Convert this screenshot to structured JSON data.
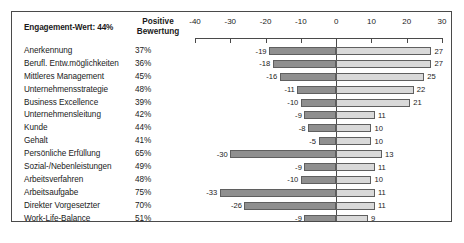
{
  "header": {
    "engagement_title": "Engagement-Wert: 44%",
    "positive_line1": "Positive",
    "positive_line2": "Bewertung"
  },
  "chart_data": {
    "type": "bar",
    "orientation": "horizontal",
    "style": "diverging-stacked",
    "title": "Engagement-Wert: 44%",
    "xlabel": "",
    "ylabel": "",
    "xlim": [
      -40,
      30
    ],
    "xticks": [
      -40,
      -30,
      -20,
      -10,
      0,
      10,
      20,
      30
    ],
    "xtick_labels": [
      "-40",
      "-30",
      "-20",
      "-10",
      "0",
      "10",
      "20",
      "30"
    ],
    "grid": false,
    "legend": null,
    "axis_position": "top",
    "columns": [
      "Kategorie",
      "Positive Bewertung",
      "Negativ",
      "Positiv"
    ],
    "categories": [
      "Anerkennung",
      "Berufl. Entw.möglichkeiten",
      "Mittleres Management",
      "Unternehmensstrategie",
      "Business Excellence",
      "Unternehmensleitung",
      "Kunde",
      "Gehalt",
      "Persönliche Erfüllung",
      "Sozial-/Nebenleistungen",
      "Arbeitsverfahren",
      "Arbeitsaufgabe",
      "Direkter Vorgesetzter",
      "Work-Life-Balance",
      "Arbeitsmittel/Ressourcen",
      "Kollegen"
    ],
    "positive_bewertung": [
      "37%",
      "36%",
      "45%",
      "48%",
      "39%",
      "42%",
      "44%",
      "41%",
      "65%",
      "49%",
      "48%",
      "75%",
      "70%",
      "51%",
      "53%",
      "86%"
    ],
    "series": [
      {
        "name": "Negativ",
        "color": "#8f8f8f",
        "values": [
          -19,
          -18,
          -16,
          -11,
          -10,
          -9,
          -8,
          -5,
          -30,
          -9,
          -10,
          -33,
          -26,
          -9,
          -8,
          -24
        ]
      },
      {
        "name": "Positiv",
        "color": "#d9d9d9",
        "values": [
          27,
          27,
          25,
          22,
          21,
          11,
          10,
          10,
          13,
          11,
          10,
          11,
          11,
          9,
          7,
          4
        ]
      }
    ],
    "rows": [
      {
        "label": "Anerkennung",
        "pct": "37%",
        "neg": -19,
        "pos": 27,
        "neg_label": "-19",
        "pos_label": "27"
      },
      {
        "label": "Berufl. Entw.möglichkeiten",
        "pct": "36%",
        "neg": -18,
        "pos": 27,
        "neg_label": "-18",
        "pos_label": "27"
      },
      {
        "label": "Mittleres Management",
        "pct": "45%",
        "neg": -16,
        "pos": 25,
        "neg_label": "-16",
        "pos_label": "25"
      },
      {
        "label": "Unternehmensstrategie",
        "pct": "48%",
        "neg": -11,
        "pos": 22,
        "neg_label": "-11",
        "pos_label": "22"
      },
      {
        "label": "Business Excellence",
        "pct": "39%",
        "neg": -10,
        "pos": 21,
        "neg_label": "-10",
        "pos_label": "21"
      },
      {
        "label": "Unternehmensleitung",
        "pct": "42%",
        "neg": -9,
        "pos": 11,
        "neg_label": "-9",
        "pos_label": "11"
      },
      {
        "label": "Kunde",
        "pct": "44%",
        "neg": -8,
        "pos": 10,
        "neg_label": "-8",
        "pos_label": "10"
      },
      {
        "label": "Gehalt",
        "pct": "41%",
        "neg": -5,
        "pos": 10,
        "neg_label": "-5",
        "pos_label": "10"
      },
      {
        "label": "Persönliche Erfüllung",
        "pct": "65%",
        "neg": -30,
        "pos": 13,
        "neg_label": "-30",
        "pos_label": "13"
      },
      {
        "label": "Sozial-/Nebenleistungen",
        "pct": "49%",
        "neg": -9,
        "pos": 11,
        "neg_label": "-9",
        "pos_label": "11"
      },
      {
        "label": "Arbeitsverfahren",
        "pct": "48%",
        "neg": -10,
        "pos": 10,
        "neg_label": "-10",
        "pos_label": "10"
      },
      {
        "label": "Arbeitsaufgabe",
        "pct": "75%",
        "neg": -33,
        "pos": 11,
        "neg_label": "-33",
        "pos_label": "11"
      },
      {
        "label": "Direkter Vorgesetzter",
        "pct": "70%",
        "neg": -26,
        "pos": 11,
        "neg_label": "-26",
        "pos_label": "11"
      },
      {
        "label": "Work-Life-Balance",
        "pct": "51%",
        "neg": -9,
        "pos": 9,
        "neg_label": "-9",
        "pos_label": "9"
      },
      {
        "label": "Arbeitsmittel/Ressourcen",
        "pct": "53%",
        "neg": -8,
        "pos": 7,
        "neg_label": "-8",
        "pos_label": "7"
      },
      {
        "label": "Kollegen",
        "pct": "86%",
        "neg": -24,
        "pos": 4,
        "neg_label": "-24",
        "pos_label": "4"
      }
    ]
  },
  "colors": {
    "negative_bar": "#8f8f8f",
    "positive_bar": "#d9d9d9",
    "bar_border": "#5f5f5f",
    "frame": "#4a4a4a",
    "text": "#1a1a1a"
  }
}
